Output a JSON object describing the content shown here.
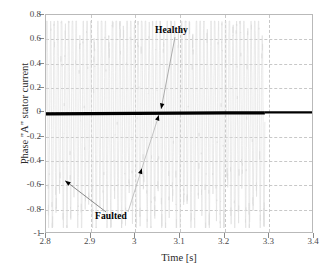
{
  "chart_data": {
    "type": "line",
    "title": "",
    "xlabel": "Time [s]",
    "ylabel": "Phase \"A\" stator current",
    "xlim": [
      2.8,
      3.4
    ],
    "ylim": [
      -1,
      0.8
    ],
    "xticks": [
      "2.8",
      "2.9",
      "3",
      "3.1",
      "3.2",
      "3.3",
      "3.4"
    ],
    "xtick_values": [
      2.8,
      2.9,
      3.0,
      3.1,
      3.2,
      3.3,
      3.4
    ],
    "yticks": [
      "0.8",
      "0.6",
      "0.4",
      "0.2",
      "0",
      "-0.2",
      "-0.4",
      "-0.6",
      "-0.8",
      "-1"
    ],
    "ytick_values": [
      0.8,
      0.6,
      0.4,
      0.2,
      0,
      -0.2,
      -0.4,
      -0.6,
      -0.8,
      -1
    ],
    "grid": true,
    "grid_style": "dashed",
    "grid_color": "#c8c8c8",
    "legend": "none",
    "series": [
      {
        "name": "Healthy",
        "color": "#000000",
        "width": 3.2,
        "description": "Thick near-zero flat trace across the full time range; becomes slightly thinner after t = 3.29 s",
        "x": [
          2.8,
          2.9,
          3.0,
          3.1,
          3.2,
          3.29,
          3.3,
          3.4
        ],
        "values": [
          -0.012,
          -0.01,
          -0.008,
          -0.006,
          -0.005,
          -0.004,
          0.0,
          0.0
        ]
      },
      {
        "name": "Faulted",
        "color": "#dcdcdc",
        "width": 0.6,
        "description": "Very light gray high-frequency oscillation with envelope roughly -0.95 to +0.75, damping out near t = 3.29 s",
        "envelope_min": -0.95,
        "envelope_max": 0.75,
        "oscillation_end": 3.29,
        "cycles": 60
      }
    ],
    "annotations": [
      {
        "name": "Healthy",
        "label": "Healthy",
        "label_x": 3.1,
        "label_y": 0.66,
        "target_x": 3.06,
        "target_y": 0.02,
        "arrow": "down"
      },
      {
        "name": "Faulted",
        "label": "Faulted",
        "label_x": 2.95,
        "label_y": -0.86,
        "targets": [
          {
            "target_x": 2.845,
            "target_y": -0.57,
            "arrow": "up-left"
          },
          {
            "target_x": 3.055,
            "target_y": -0.03,
            "arrow": "up-right"
          }
        ]
      }
    ]
  }
}
